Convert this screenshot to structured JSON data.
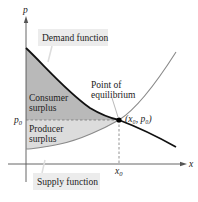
{
  "diagram": {
    "axes": {
      "x_label": "x",
      "y_label": "p",
      "x_tick": "x",
      "x_tick_sub": "0",
      "y_tick": "p",
      "y_tick_sub": "0"
    },
    "callouts": {
      "demand": "Demand function",
      "supply": "Supply function",
      "equilibrium_line1": "Point of",
      "equilibrium_line2": "equilibrium",
      "equilibrium_coord": "(x₀, p₀)"
    },
    "regions": {
      "consumer_line1": "Consumer",
      "consumer_line2": "surplus",
      "producer_line1": "Producer",
      "producer_line2": "surplus"
    },
    "colors": {
      "consumer_fill": "#b9b9b9",
      "producer_fill": "#dcdcdc",
      "demand_curve": "#111111",
      "supply_curve": "#8a8a8a",
      "callout_bg": "#ececec",
      "axis": "#555555"
    }
  }
}
